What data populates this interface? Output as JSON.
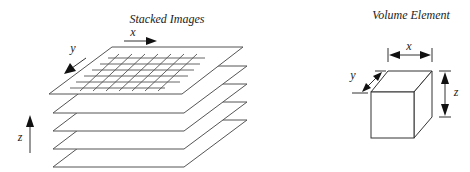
{
  "stacked_images": {
    "title": "Stacked Images",
    "axis_x_label": "x",
    "axis_y_label": "y",
    "axis_z_label": "z",
    "plane_count": 5,
    "grid": {
      "rows": 6,
      "columns": 7
    }
  },
  "volume_element": {
    "title": "Volume Element",
    "dim_x_label": "x",
    "dim_y_label": "y",
    "dim_z_label": "z"
  },
  "colors": {
    "line": "#333333",
    "plane_stroke": "#555555",
    "background": "#ffffff"
  }
}
